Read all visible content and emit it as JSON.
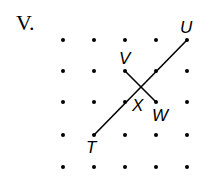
{
  "problem": {
    "label": "V."
  },
  "diagram": {
    "grid": {
      "columns": 5,
      "rows": 5,
      "x": [
        63,
        94,
        125,
        156,
        187
      ],
      "y": [
        40,
        71,
        102,
        135,
        167
      ]
    },
    "points": [
      {
        "name": "U",
        "col": 4,
        "row": 0
      },
      {
        "name": "V",
        "col": 2,
        "row": 1
      },
      {
        "name": "W",
        "col": 3,
        "row": 2
      },
      {
        "name": "T",
        "col": 1,
        "row": 3
      },
      {
        "name": "X",
        "note": "intersection of TU and VW"
      }
    ],
    "segments": [
      {
        "from": "T",
        "to": "U"
      },
      {
        "from": "V",
        "to": "W"
      }
    ],
    "colors": {
      "ink": "#000000",
      "background": "#ffffff"
    }
  }
}
